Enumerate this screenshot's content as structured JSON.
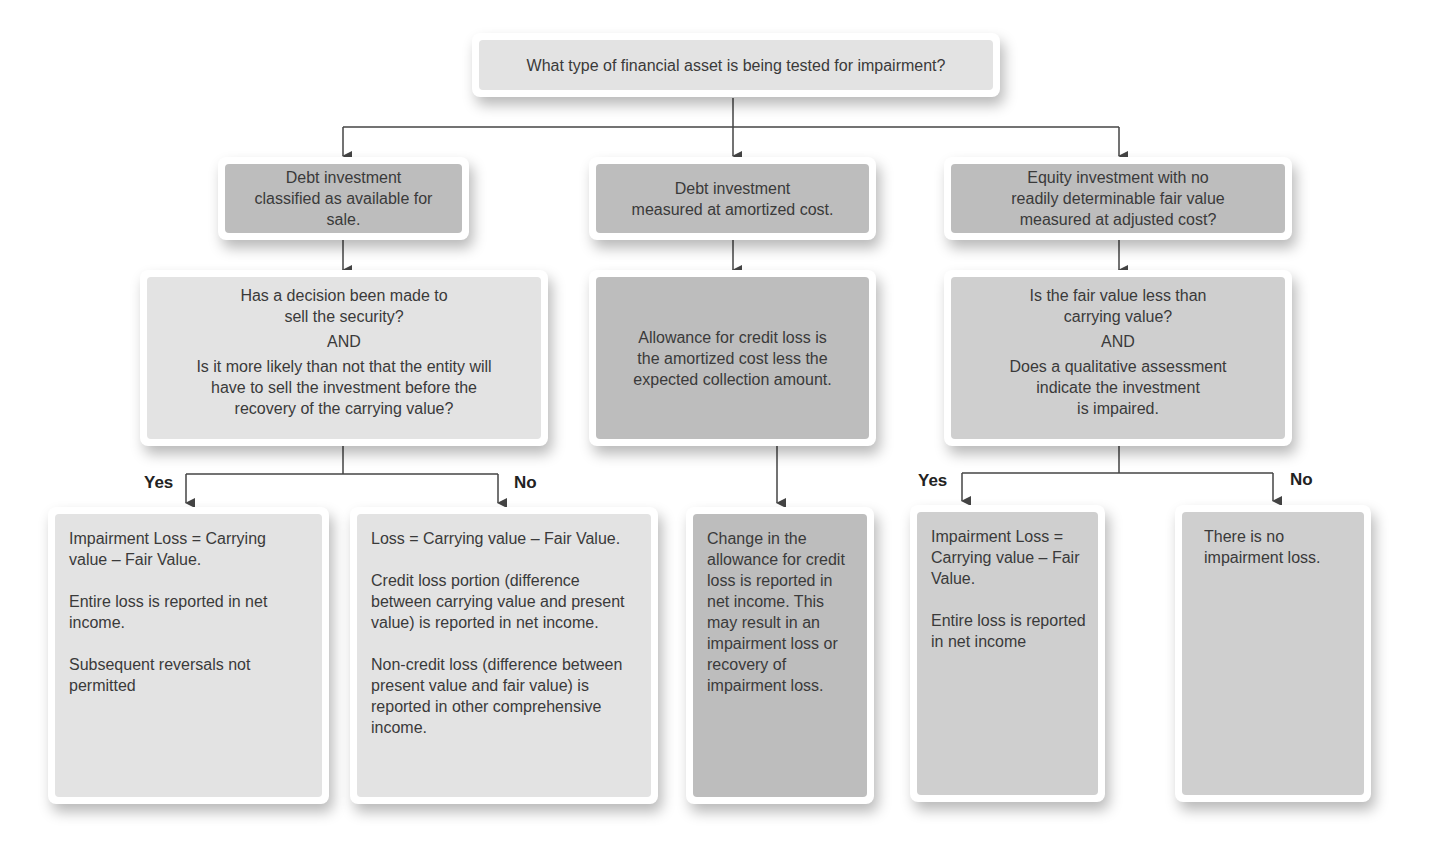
{
  "diagram": {
    "root": {
      "text": "What type of financial asset is being tested for impairment?"
    },
    "branches": [
      {
        "category": {
          "lines": [
            "Debt investment",
            "classified as available for",
            "sale."
          ]
        },
        "question": {
          "lines_a": [
            "Has a decision been made to",
            "sell the security?"
          ],
          "connector": "AND",
          "lines_b": [
            "Is it more likely than not that the entity will",
            "have to sell the investment before the",
            "recovery of the carrying value?"
          ]
        },
        "outcomes": [
          {
            "edge_label": "Yes",
            "paragraphs": [
              "Impairment Loss = Carrying value – Fair Value.",
              "Entire loss is reported in net income.",
              "Subsequent reversals not permitted"
            ]
          },
          {
            "edge_label": "No",
            "paragraphs": [
              "Loss = Carrying value – Fair Value.",
              "Credit loss portion (difference between carrying value and present value) is reported in net income.",
              "Non-credit loss (difference between present value and fair value)  is reported in other comprehensive income."
            ]
          }
        ]
      },
      {
        "category": {
          "lines": [
            "Debt investment",
            "measured at amortized cost."
          ]
        },
        "question": {
          "lines": [
            "Allowance for credit loss is",
            "the amortized cost less the",
            "expected collection amount."
          ]
        },
        "outcomes": [
          {
            "edge_label": "",
            "paragraphs": [
              "Change in the allowance for credit loss is reported in net income. This may result in an impairment loss or recovery of impairment loss."
            ]
          }
        ]
      },
      {
        "category": {
          "lines": [
            "Equity investment with no",
            "readily determinable fair value",
            "measured at adjusted cost?"
          ]
        },
        "question": {
          "lines_a": [
            "Is the fair value less than",
            "carrying value?"
          ],
          "connector": "AND",
          "lines_b": [
            "Does a qualitative assessment",
            "indicate the investment",
            "is impaired."
          ]
        },
        "outcomes": [
          {
            "edge_label": "Yes",
            "paragraphs": [
              "Impairment Loss = Carrying value – Fair Value.",
              "Entire loss is reported in net income"
            ]
          },
          {
            "edge_label": "No",
            "paragraphs": [
              "There is no impairment loss."
            ]
          }
        ]
      }
    ]
  },
  "colors": {
    "light_fill": "#e3e3e3",
    "mid_fill": "#cfcfcf",
    "dark_fill": "#bdbdbd",
    "connector": "#444444",
    "text": "#3a3a3a"
  }
}
